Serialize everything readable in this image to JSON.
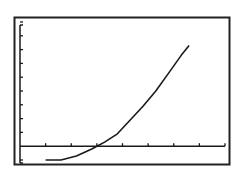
{
  "screen": {
    "label": "Graphing calculator graph screen",
    "colors": {
      "background": "#ffffff",
      "ink": "#1a1a1a",
      "frame": "#222222"
    }
  },
  "chart_data": {
    "type": "line",
    "title": "",
    "xlabel": "",
    "ylabel": "",
    "grid": false,
    "legend": null,
    "xlim": [
      0,
      8
    ],
    "ylim": [
      -1,
      9
    ],
    "x_ticks": [
      1,
      2,
      3,
      4,
      5,
      6,
      7,
      8
    ],
    "y_ticks": [
      -1,
      1,
      2,
      3,
      4,
      5,
      6,
      7,
      8,
      9
    ],
    "series": [
      {
        "name": "curve",
        "x": [
          1.0,
          1.6,
          2.2,
          2.8,
          3.0,
          3.3,
          3.8,
          4.3,
          4.8,
          5.3,
          5.8,
          6.3,
          6.6
        ],
        "y": [
          -1.0,
          -1.0,
          -0.7,
          -0.2,
          0.0,
          0.3,
          0.9,
          1.9,
          2.9,
          4.0,
          5.3,
          6.6,
          7.3
        ]
      }
    ]
  }
}
